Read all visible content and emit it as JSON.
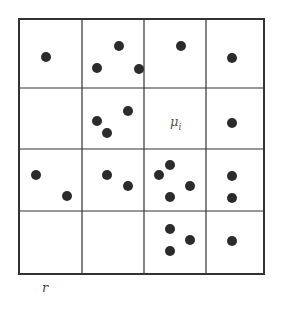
{
  "diagram": {
    "type": "grid-point-distribution",
    "grid": {
      "rows": 4,
      "cols": 4,
      "x_lines": [
        19,
        82,
        144,
        206,
        264
      ],
      "y_lines": [
        19,
        88,
        149,
        211,
        274
      ],
      "line_color": "#333333",
      "border_width": 2,
      "inner_width": 1.2
    },
    "points": {
      "color": "#2b2b2b",
      "radius": 5,
      "coords": [
        [
          46,
          57
        ],
        [
          119,
          46
        ],
        [
          97,
          68
        ],
        [
          139,
          69
        ],
        [
          181,
          46
        ],
        [
          232,
          58
        ],
        [
          97,
          121
        ],
        [
          128,
          111
        ],
        [
          107,
          133
        ],
        [
          232,
          123
        ],
        [
          36,
          175
        ],
        [
          67,
          196
        ],
        [
          107,
          175
        ],
        [
          128,
          186
        ],
        [
          170,
          165
        ],
        [
          159,
          175
        ],
        [
          190,
          186
        ],
        [
          170,
          197
        ],
        [
          232,
          176
        ],
        [
          232,
          198
        ],
        [
          170,
          229
        ],
        [
          190,
          240
        ],
        [
          170,
          251
        ],
        [
          232,
          241
        ]
      ]
    },
    "labels": {
      "cell_label": "μ",
      "cell_label_sub": "i",
      "axis_label": "r"
    }
  }
}
